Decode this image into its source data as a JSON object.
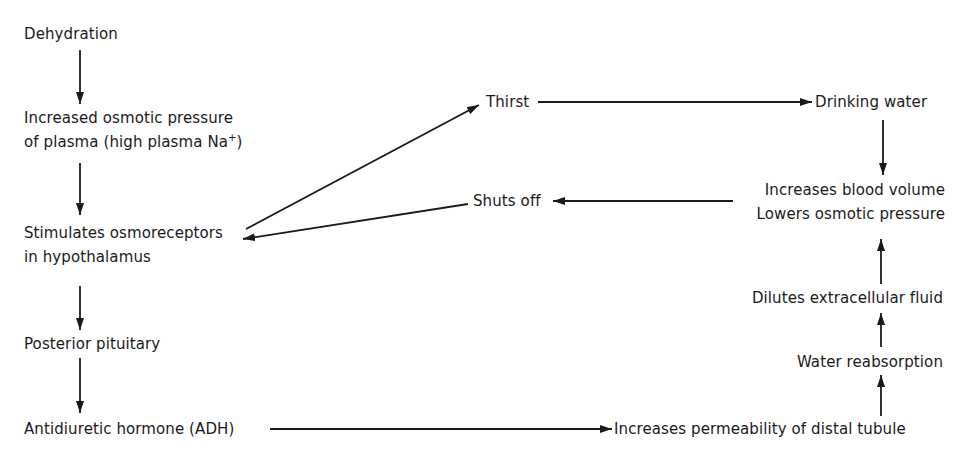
{
  "diagram": {
    "colors": {
      "ink": "#1a1a1a",
      "background": "#ffffff"
    },
    "nodes": {
      "dehydration": "Dehydration",
      "osmotic_pressure_line1": "Increased osmotic pressure",
      "osmotic_pressure_line2": "of plasma (high plasma Na",
      "osmotic_pressure_sup": "+",
      "osmotic_pressure_close": ")",
      "osmoreceptors_line1": "Stimulates osmoreceptors",
      "osmoreceptors_line2": "in hypothalamus",
      "posterior_pituitary": "Posterior pituitary",
      "adh": "Antidiuretic hormone (ADH)",
      "thirst": "Thirst",
      "shuts_off": "Shuts off",
      "drinking_water": "Drinking water",
      "blood_volume_line1": "Increases blood volume",
      "blood_volume_line2": "Lowers osmotic pressure",
      "dilutes": "Dilutes extracellular fluid",
      "water_reabsorption": "Water reabsorption",
      "permeability": "Increases permeability of distal tubule"
    },
    "edges": [
      {
        "from": "Dehydration",
        "to": "Increased osmotic pressure"
      },
      {
        "from": "Increased osmotic pressure",
        "to": "Stimulates osmoreceptors"
      },
      {
        "from": "Stimulates osmoreceptors",
        "to": "Posterior pituitary"
      },
      {
        "from": "Posterior pituitary",
        "to": "Antidiuretic hormone (ADH)"
      },
      {
        "from": "Stimulates osmoreceptors",
        "to": "Thirst"
      },
      {
        "from": "Thirst",
        "to": "Drinking water"
      },
      {
        "from": "Drinking water",
        "to": "Increases blood volume"
      },
      {
        "from": "Increases blood volume",
        "to": "Shuts off"
      },
      {
        "from": "Shuts off",
        "to": "Stimulates osmoreceptors"
      },
      {
        "from": "Antidiuretic hormone (ADH)",
        "to": "Increases permeability of distal tubule"
      },
      {
        "from": "Increases permeability of distal tubule",
        "to": "Water reabsorption"
      },
      {
        "from": "Water reabsorption",
        "to": "Dilutes extracellular fluid"
      },
      {
        "from": "Dilutes extracellular fluid",
        "to": "Increases blood volume"
      }
    ]
  }
}
